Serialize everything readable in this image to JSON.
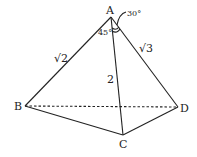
{
  "diagram": {
    "type": "tetrahedron",
    "vertices": {
      "A": {
        "label": "A",
        "x": 111,
        "y": 17
      },
      "B": {
        "label": "B",
        "x": 25,
        "y": 106
      },
      "C": {
        "label": "C",
        "x": 123,
        "y": 135
      },
      "D": {
        "label": "D",
        "x": 178,
        "y": 107
      }
    },
    "edges": [
      {
        "from": "A",
        "to": "B",
        "label": "√2",
        "style": "solid"
      },
      {
        "from": "A",
        "to": "C",
        "label": "2",
        "style": "solid"
      },
      {
        "from": "A",
        "to": "D",
        "label": "√3",
        "style": "solid"
      },
      {
        "from": "B",
        "to": "C",
        "label": "",
        "style": "solid"
      },
      {
        "from": "C",
        "to": "D",
        "label": "",
        "style": "solid"
      },
      {
        "from": "B",
        "to": "D",
        "label": "",
        "style": "dashed"
      }
    ],
    "angles": [
      {
        "label": "45°",
        "between": "AB-AC"
      },
      {
        "label": "30°",
        "between": "AC-AD"
      }
    ],
    "edge_labels": {
      "AB": "√2",
      "AC": "2",
      "AD": "√3"
    },
    "angle_labels": {
      "BAC": "45°",
      "CAD": "30°"
    }
  }
}
